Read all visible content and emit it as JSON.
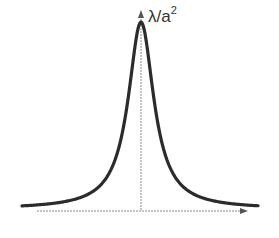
{
  "chart_data": {
    "type": "line",
    "title": "",
    "function": "Lorentzian y = λ/(a² + x²)",
    "peak_label": "λ/a",
    "peak_label_exp": "2",
    "xlabel": "",
    "ylabel": "",
    "axes": {
      "x_axis_arrow": true,
      "y_axis_arrow": true,
      "grid": false
    },
    "series": [
      {
        "name": "curve",
        "shape": "symmetric peak centered at x=0, decaying to 0 on both sides"
      }
    ],
    "colors": {
      "curve": "#2b2b2b",
      "axis": "#8a8a8a"
    }
  }
}
